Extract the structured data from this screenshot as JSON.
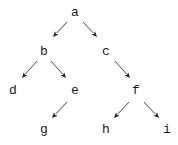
{
  "diagram": {
    "type": "tree",
    "nodes": [
      {
        "id": "a",
        "label": "a",
        "x": 75,
        "y": 12
      },
      {
        "id": "b",
        "label": "b",
        "x": 44,
        "y": 51
      },
      {
        "id": "c",
        "label": "c",
        "x": 106,
        "y": 51
      },
      {
        "id": "d",
        "label": "d",
        "x": 13,
        "y": 90
      },
      {
        "id": "e",
        "label": "e",
        "x": 75,
        "y": 90
      },
      {
        "id": "f",
        "label": "f",
        "x": 136,
        "y": 90
      },
      {
        "id": "g",
        "label": "g",
        "x": 44,
        "y": 129
      },
      {
        "id": "h",
        "label": "h",
        "x": 106,
        "y": 129
      },
      {
        "id": "i",
        "label": "i",
        "x": 167,
        "y": 129
      }
    ],
    "edges": [
      {
        "from": "a",
        "to": "b",
        "x1": 67,
        "y1": 22,
        "x2": 53,
        "y2": 37
      },
      {
        "from": "a",
        "to": "c",
        "x1": 83,
        "y1": 22,
        "x2": 97,
        "y2": 37
      },
      {
        "from": "b",
        "to": "d",
        "x1": 37,
        "y1": 61,
        "x2": 22,
        "y2": 78
      },
      {
        "from": "b",
        "to": "e",
        "x1": 51,
        "y1": 61,
        "x2": 66,
        "y2": 78
      },
      {
        "from": "c",
        "to": "f",
        "x1": 115,
        "y1": 61,
        "x2": 130,
        "y2": 78
      },
      {
        "from": "e",
        "to": "g",
        "x1": 67,
        "y1": 102,
        "x2": 52,
        "y2": 118
      },
      {
        "from": "f",
        "to": "h",
        "x1": 129,
        "y1": 102,
        "x2": 114,
        "y2": 118
      },
      {
        "from": "f",
        "to": "i",
        "x1": 144,
        "y1": 102,
        "x2": 159,
        "y2": 118
      }
    ],
    "colors": {
      "text": "#1a1a1a",
      "edge": "#333333",
      "background": "#ffffff"
    }
  }
}
